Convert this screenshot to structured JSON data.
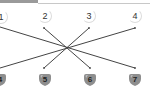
{
  "diagram": {
    "type": "matching-lines",
    "top_nodes": [
      {
        "label": "1",
        "x": 1,
        "y": 16
      },
      {
        "label": "2",
        "x": 44,
        "y": 16
      },
      {
        "label": "3",
        "x": 89,
        "y": 16
      },
      {
        "label": "4",
        "x": 135,
        "y": 16
      }
    ],
    "bottom_nodes": [
      {
        "label": "4",
        "x": 0,
        "y": 80
      },
      {
        "label": "5",
        "x": 45,
        "y": 80
      },
      {
        "label": "6",
        "x": 90,
        "y": 80
      },
      {
        "label": "7",
        "x": 135,
        "y": 80
      }
    ],
    "connections": [
      {
        "from": "1",
        "to": "7"
      },
      {
        "from": "2",
        "to": "6"
      },
      {
        "from": "3",
        "to": "5"
      },
      {
        "from": "4",
        "to": "4"
      }
    ],
    "colors": {
      "line": "#444444",
      "shield_fill": "#8e8e8e",
      "shield_highlight": "#c4c4c4",
      "top_bar": "#9a9a9a"
    }
  }
}
